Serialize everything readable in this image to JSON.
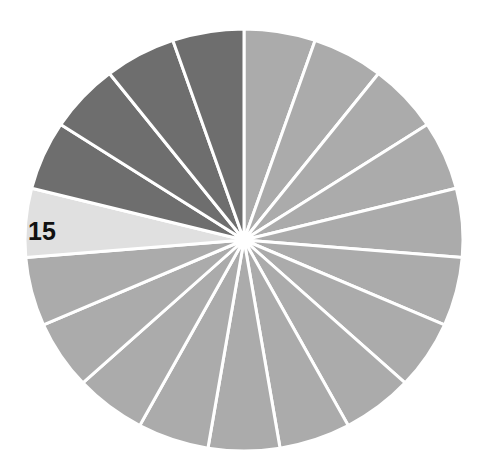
{
  "chart_data": {
    "type": "pie",
    "title": "",
    "start_angle_deg": 0,
    "direction": "clockwise",
    "categories": [
      "1",
      "2",
      "3",
      "4",
      "5",
      "6",
      "7",
      "8",
      "9",
      "10",
      "11",
      "12",
      "13",
      "14",
      "15",
      "16",
      "17",
      "18",
      "19"
    ],
    "values": [
      1,
      1,
      1,
      1,
      1,
      1,
      1,
      1,
      1,
      1,
      1,
      1,
      1,
      1,
      1,
      1,
      1,
      1,
      1
    ],
    "colors": [
      "#ababab",
      "#ababab",
      "#ababab",
      "#ababab",
      "#ababab",
      "#ababab",
      "#ababab",
      "#ababab",
      "#ababab",
      "#ababab",
      "#ababab",
      "#ababab",
      "#ababab",
      "#ababab",
      "#e0e0e0",
      "#6e6e6e",
      "#6e6e6e",
      "#6e6e6e",
      "#6e6e6e"
    ],
    "highlighted_slice": "15",
    "annotations": [
      {
        "text": "15",
        "slice": "15"
      }
    ],
    "legend": "none",
    "geometry": {
      "cx": 244,
      "cy": 240,
      "rx": 219,
      "ry": 211
    },
    "label_position": {
      "x": 28,
      "y": 240
    }
  }
}
